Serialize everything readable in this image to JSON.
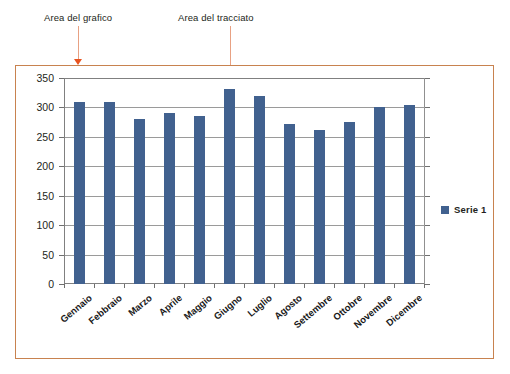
{
  "annotations": [
    {
      "id": "chart-area",
      "label": "Area del grafico"
    },
    {
      "id": "plot-area",
      "label": "Area del tracciato"
    }
  ],
  "colors": {
    "bar": "#41618f",
    "chart_area_border": "#c8824f",
    "arrow": "#e8531f",
    "arrow_shaft": "#e8a183",
    "gridline": "#9a9a9a",
    "axis": "#808080"
  },
  "chart_data": {
    "type": "bar",
    "title": "",
    "xlabel": "",
    "ylabel": "",
    "categories": [
      "Gennaio",
      "Febbraio",
      "Marzo",
      "Aprile",
      "Maggio",
      "Giugno",
      "Luglio",
      "Agosto",
      "Settembre",
      "Ottobre",
      "Novembre",
      "Dicembre"
    ],
    "series": [
      {
        "name": "Serie 1",
        "values": [
          310,
          310,
          280,
          290,
          285,
          332,
          320,
          272,
          262,
          276,
          301,
          305
        ]
      }
    ],
    "ylim": [
      0,
      350
    ],
    "ytick_step": 50,
    "yticks": [
      0,
      50,
      100,
      150,
      200,
      250,
      300,
      350
    ],
    "ytick_labels": [
      "0",
      "50",
      "100",
      "150",
      "200",
      "250",
      "300",
      "350"
    ],
    "grid": true,
    "legend_position": "right",
    "legend_entries": [
      "Serie 1"
    ]
  }
}
